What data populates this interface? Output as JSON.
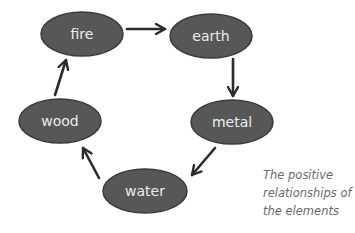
{
  "diagram": {
    "title": "The positive relationships of the elements",
    "colors": {
      "node_fill": "#575757",
      "node_stroke": "#3a3a3a",
      "node_text": "#ececec",
      "arrow": "#2b2b2b",
      "caption": "#6a6a6a"
    },
    "nodes": [
      {
        "id": "fire",
        "label": "fire",
        "cx": 82,
        "cy": 34,
        "rx": 41,
        "ry": 22
      },
      {
        "id": "earth",
        "label": "earth",
        "cx": 211,
        "cy": 36,
        "rx": 41,
        "ry": 22
      },
      {
        "id": "metal",
        "label": "metal",
        "cx": 232,
        "cy": 122,
        "rx": 41,
        "ry": 22
      },
      {
        "id": "water",
        "label": "water",
        "cx": 145,
        "cy": 191,
        "rx": 42,
        "ry": 22
      },
      {
        "id": "wood",
        "label": "wood",
        "cx": 60,
        "cy": 121,
        "rx": 41,
        "ry": 22
      }
    ],
    "edges": [
      {
        "from": "fire",
        "to": "earth",
        "x1": 127,
        "y1": 29,
        "x2": 165,
        "y2": 29
      },
      {
        "from": "earth",
        "to": "metal",
        "x1": 233,
        "y1": 59,
        "x2": 233,
        "y2": 96
      },
      {
        "from": "metal",
        "to": "water",
        "x1": 215,
        "y1": 148,
        "x2": 192,
        "y2": 175
      },
      {
        "from": "water",
        "to": "wood",
        "x1": 99,
        "y1": 178,
        "x2": 83,
        "y2": 148
      },
      {
        "from": "wood",
        "to": "fire",
        "x1": 55,
        "y1": 95,
        "x2": 66,
        "y2": 60
      }
    ],
    "caption_lines": [
      "The positive",
      "relationships of",
      "the elements"
    ]
  }
}
